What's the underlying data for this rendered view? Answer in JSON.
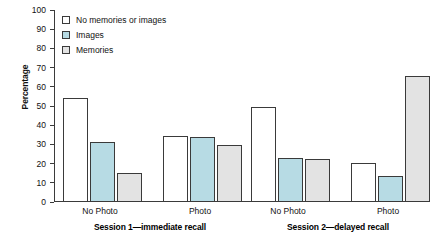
{
  "chart_data": {
    "type": "bar",
    "title": "",
    "subtitle": "",
    "xlabel": "",
    "ylabel": "Percentage",
    "ylim": [
      0,
      100
    ],
    "ytick_labels": [
      "100",
      "90",
      "80",
      "70",
      "60",
      "50",
      "40",
      "30",
      "20",
      "10",
      "0"
    ],
    "ytick_values": [
      100,
      90,
      80,
      70,
      60,
      50,
      40,
      30,
      20,
      10,
      0
    ],
    "grid": false,
    "legend_position": "top-left",
    "categories": [
      "No Photo",
      "Photo",
      "No Photo",
      "Photo"
    ],
    "group_labels": [
      "Session 1—immediate recall",
      "Session 2—delayed recall"
    ],
    "series": [
      {
        "name": "No memories or images",
        "color": "#ffffff",
        "values": [
          54,
          34.5,
          49.5,
          20.5
        ]
      },
      {
        "name": "Images",
        "color": "#b7dbe4",
        "values": [
          31.5,
          34,
          23,
          13.5
        ]
      },
      {
        "name": "Memories",
        "color": "#e3e3e3",
        "values": [
          15,
          29.5,
          22.5,
          65.5
        ]
      }
    ]
  },
  "axis": {
    "y_title": "Percentage"
  },
  "legend": {
    "items": [
      {
        "label": "No memories or images",
        "color": "#ffffff"
      },
      {
        "label": "Images",
        "color": "#b7dbe4"
      },
      {
        "label": "Memories",
        "color": "#e3e3e3"
      }
    ]
  },
  "x_axis": {
    "tick_labels": [
      "No Photo",
      "Photo",
      "No Photo",
      "Photo"
    ],
    "session_labels": [
      "Session 1—immediate recall",
      "Session 2—delayed recall"
    ]
  },
  "colors": {
    "axis": "#3b3b3b",
    "bar_outline": "#3a3a3a",
    "background": "#ffffff"
  }
}
